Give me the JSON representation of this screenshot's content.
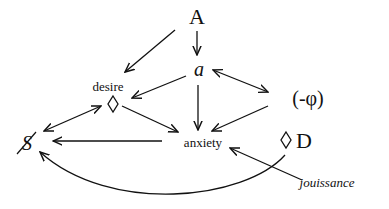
{
  "diagram": {
    "nodes": {
      "A": {
        "label": "A"
      },
      "a": {
        "label": "a"
      },
      "desire": {
        "label": "desire"
      },
      "desire_diamond": {
        "label": "◇"
      },
      "minus_phi": {
        "label": "(-φ)"
      },
      "barred_S": {
        "label": "S"
      },
      "anxiety": {
        "label": "anxiety"
      },
      "diamond_D": {
        "label": "◇ D"
      },
      "jouissance": {
        "label": "jouissance"
      }
    },
    "edges": [
      {
        "from": "A",
        "to": "desire",
        "type": "arrow"
      },
      {
        "from": "A",
        "to": "a",
        "type": "arrow"
      },
      {
        "from": "a",
        "to": "desire_diamond",
        "type": "arrow"
      },
      {
        "from": "a",
        "to": "minus_phi",
        "type": "bidirectional"
      },
      {
        "from": "a",
        "to": "anxiety",
        "type": "arrow"
      },
      {
        "from": "desire_diamond",
        "to": "anxiety",
        "type": "arrow"
      },
      {
        "from": "minus_phi",
        "to": "anxiety",
        "type": "arrow"
      },
      {
        "from": "barred_S",
        "to": "desire_diamond",
        "type": "bidirectional"
      },
      {
        "from": "anxiety",
        "to": "barred_S",
        "type": "arrow"
      },
      {
        "from": "jouissance",
        "to": "anxiety",
        "type": "arrow"
      },
      {
        "from": "diamond_D",
        "to": "barred_S",
        "type": "curved-arrow"
      }
    ]
  }
}
